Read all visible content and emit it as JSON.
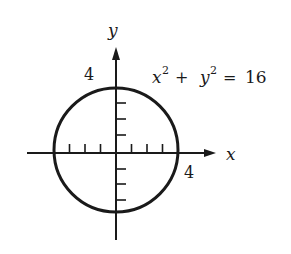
{
  "diagram": {
    "type": "circle-graph",
    "equation": {
      "lhs_x": "x",
      "sup_x": "2",
      "plus": "+",
      "lhs_y": "y",
      "sup_y": "2",
      "equals": "=",
      "rhs": "16",
      "full": "x² + y² = 16"
    },
    "axes": {
      "x_label": "x",
      "y_label": "y",
      "x_tick_label": "4",
      "y_tick_label": "4",
      "tick_count_per_half_axis": 3
    },
    "circle": {
      "center": [
        0,
        0
      ],
      "radius": 4
    },
    "colors": {
      "stroke": "#1a1a1a",
      "background": "#ffffff"
    }
  }
}
